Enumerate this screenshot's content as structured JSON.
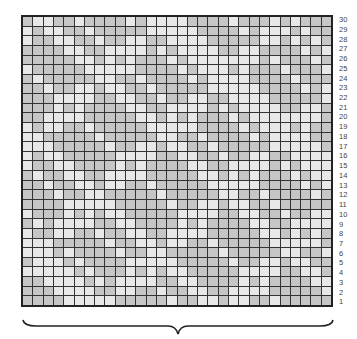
{
  "chart": {
    "rows": 30,
    "cols": 30,
    "row_numbers": [
      "30",
      "29",
      "28",
      "27",
      "26",
      "25",
      "24",
      "23",
      "22",
      "21",
      "20",
      "19",
      "18",
      "17",
      "16",
      "15",
      "14",
      "13",
      "12",
      "11",
      "10",
      "9",
      "8",
      "7",
      "6",
      "5",
      "4",
      "3",
      "2",
      "1"
    ],
    "colors": {
      "light": "#e8e8e8",
      "medium": "#c6c6c6",
      "gridline": "#333333",
      "border": "#222222"
    },
    "pattern_description": "diagonal diamond lattice of light and medium grey stitches"
  },
  "brace": {
    "label": ""
  }
}
